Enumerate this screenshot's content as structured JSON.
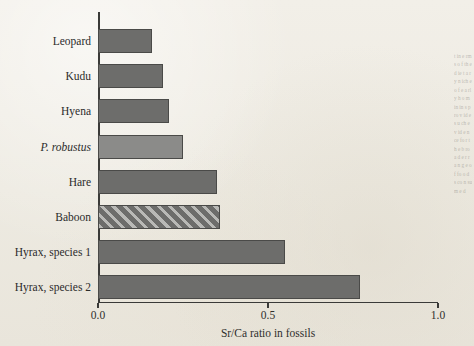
{
  "chart_data": {
    "type": "bar",
    "orientation": "horizontal",
    "title": "",
    "xlabel": "Sr/Ca ratio in fossils",
    "ylabel": "",
    "xlim": [
      0.0,
      1.0
    ],
    "xticks": [
      "0.0",
      "0.5",
      "1.0"
    ],
    "xtick_values": [
      0.0,
      0.5,
      1.0
    ],
    "grid": false,
    "legend": "none",
    "categories": [
      "Leopard",
      "Kudu",
      "Hyena",
      "P. robustus",
      "Hare",
      "Baboon",
      "Hyrax, species 1",
      "Hyrax, species 2"
    ],
    "values": [
      0.16,
      0.19,
      0.21,
      0.25,
      0.35,
      0.36,
      0.55,
      0.77
    ],
    "bars": [
      {
        "label": "Leopard",
        "value": 0.16,
        "style": "dark",
        "italic": false
      },
      {
        "label": "Kudu",
        "value": 0.19,
        "style": "dark",
        "italic": false
      },
      {
        "label": "Hyena",
        "value": 0.21,
        "style": "dark",
        "italic": false
      },
      {
        "label": "P. robustus",
        "value": 0.25,
        "style": "light",
        "italic": true
      },
      {
        "label": "Hare",
        "value": 0.35,
        "style": "dark",
        "italic": false
      },
      {
        "label": "Baboon",
        "value": 0.36,
        "style": "hatch",
        "italic": false
      },
      {
        "label": "Hyrax, species 1",
        "value": 0.55,
        "style": "dark",
        "italic": false
      },
      {
        "label": "Hyrax, species 2",
        "value": 0.77,
        "style": "dark",
        "italic": false
      }
    ],
    "colors": {
      "background": "#efece4",
      "axis": "#3a3a38",
      "bar_dark": "#6d6d6b",
      "bar_light": "#8b8b89",
      "bar_hatch_light": "#b9b9b6",
      "text": "#2b2b2b"
    }
  },
  "margin_bleed": {
    "text": "t in e rm s o f th e d ie t a ry n ich e o f e a rly h o m in in s p ro v id e s u ch ev id e n ce fo r th e b ro a d e r ra n g e o f fo o d s co n su m e d"
  }
}
